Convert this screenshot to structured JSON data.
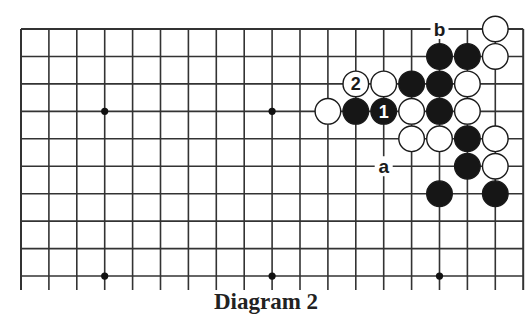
{
  "diagram": {
    "caption": "Diagram 2",
    "board": {
      "columns": 19,
      "rows_visible": 10,
      "origin_x": 21,
      "origin_y": 29,
      "spacing_x": 27.9,
      "spacing_y": 27.45,
      "open_bottom": true,
      "line_color": "#333333",
      "hoshi": [
        [
          3,
          3
        ],
        [
          9,
          3
        ],
        [
          3,
          9
        ],
        [
          9,
          9
        ],
        [
          15,
          9
        ]
      ]
    },
    "stones": [
      {
        "col": 17,
        "row": 0,
        "color": "white"
      },
      {
        "col": 15,
        "row": 1,
        "color": "black"
      },
      {
        "col": 16,
        "row": 1,
        "color": "black"
      },
      {
        "col": 17,
        "row": 1,
        "color": "white"
      },
      {
        "col": 12,
        "row": 2,
        "color": "white",
        "label": "2"
      },
      {
        "col": 13,
        "row": 2,
        "color": "white"
      },
      {
        "col": 14,
        "row": 2,
        "color": "black"
      },
      {
        "col": 15,
        "row": 2,
        "color": "black"
      },
      {
        "col": 16,
        "row": 2,
        "color": "white"
      },
      {
        "col": 11,
        "row": 3,
        "color": "white"
      },
      {
        "col": 12,
        "row": 3,
        "color": "black"
      },
      {
        "col": 13,
        "row": 3,
        "color": "black",
        "label": "1"
      },
      {
        "col": 14,
        "row": 3,
        "color": "white"
      },
      {
        "col": 15,
        "row": 3,
        "color": "black"
      },
      {
        "col": 16,
        "row": 3,
        "color": "white"
      },
      {
        "col": 14,
        "row": 4,
        "color": "white"
      },
      {
        "col": 15,
        "row": 4,
        "color": "white"
      },
      {
        "col": 16,
        "row": 4,
        "color": "black"
      },
      {
        "col": 17,
        "row": 4,
        "color": "white"
      },
      {
        "col": 16,
        "row": 5,
        "color": "black"
      },
      {
        "col": 17,
        "row": 5,
        "color": "white"
      },
      {
        "col": 15,
        "row": 6,
        "color": "black"
      },
      {
        "col": 17,
        "row": 6,
        "color": "black"
      }
    ],
    "markers": [
      {
        "col": 15,
        "row": 0,
        "label": "b"
      },
      {
        "col": 13,
        "row": 5,
        "label": "a"
      }
    ]
  }
}
